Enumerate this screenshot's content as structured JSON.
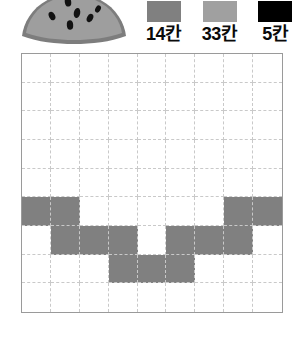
{
  "illustration": {
    "name": "watermelon-slice",
    "rind_color": "#7d7d7d",
    "flesh_color": "#9b9b9b",
    "seed_color": "#101010",
    "seed_count": 6
  },
  "legend": {
    "items": [
      {
        "label": "14칸",
        "color": "#808080",
        "swatch_name": "dark-gray"
      },
      {
        "label": "33칸",
        "color": "#a0a0a0",
        "swatch_name": "light-gray"
      },
      {
        "label": "5칸",
        "color": "#000000",
        "swatch_name": "black"
      }
    ]
  },
  "grid": {
    "columns": 9,
    "rows": 9,
    "fill_color": "#808080",
    "empty_color": "#ffffff",
    "border_color": "#9a9a9a",
    "gridline_color": "#c9c9c9",
    "gridline_style": "dashed",
    "filled_cells": [
      [
        5,
        0
      ],
      [
        5,
        1
      ],
      [
        5,
        7
      ],
      [
        5,
        8
      ],
      [
        6,
        1
      ],
      [
        6,
        2
      ],
      [
        6,
        3
      ],
      [
        6,
        5
      ],
      [
        6,
        6
      ],
      [
        6,
        7
      ],
      [
        7,
        3
      ],
      [
        7,
        4
      ],
      [
        7,
        5
      ]
    ],
    "filled_count": 13
  }
}
